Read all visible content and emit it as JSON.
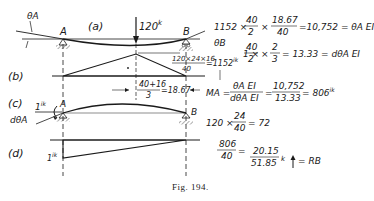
{
  "figure": {
    "caption": "Fig. 194.",
    "panels": {
      "a": {
        "label": "(a)",
        "load": "120",
        "load_unit": "k",
        "support_left": "A",
        "support_right": "B",
        "angle_left": "θA",
        "angle_right": "θB"
      },
      "b": {
        "label": "(b)",
        "peak_num": "120×24×16",
        "peak_den": "40",
        "peak_val": "=1152",
        "peak_unit": "ik",
        "centroid_num": "40+16",
        "centroid_den": "3",
        "centroid_val": "=18.67"
      },
      "c": {
        "label": "(c)",
        "moment": "1",
        "moment_unit": "ik",
        "support_left": "A",
        "support_right": "B",
        "angle": "dθA"
      },
      "d": {
        "label": "(d)",
        "moment": "1",
        "moment_unit": "ik"
      }
    },
    "equations": {
      "eq1_lead": "1152 ×",
      "eq1_f1_num": "40",
      "eq1_f1_den": "2",
      "eq1_times": "×",
      "eq1_f2_num": "18.67",
      "eq1_f2_den": "40",
      "eq1_result": "=10,752 = θA EI",
      "eq2_lead": "1 ×",
      "eq2_f1_num": "40",
      "eq2_f1_den": "2",
      "eq2_times": "×",
      "eq2_f2_num": "2",
      "eq2_f2_den": "3",
      "eq2_result": "= 13.33 = dθA EI",
      "eq3_lead": "MA =",
      "eq3_f1_num": "θA EI",
      "eq3_f1_den": "dθA EI",
      "eq3_eq": "=",
      "eq3_f2_num": "10,752",
      "eq3_f2_den": "13.33",
      "eq3_result": "= 806",
      "eq3_unit": "ik",
      "eq4_lead": "120 ×",
      "eq4_num": "24",
      "eq4_den": "40",
      "eq4_result": "= 72",
      "eq5_num": "806",
      "eq5_den": "40",
      "eq5_eq": "=",
      "eq5_r_num": "20.15",
      "eq5_r_den": "51.85",
      "eq5_unit": "k",
      "eq5_result": "= RB"
    }
  }
}
